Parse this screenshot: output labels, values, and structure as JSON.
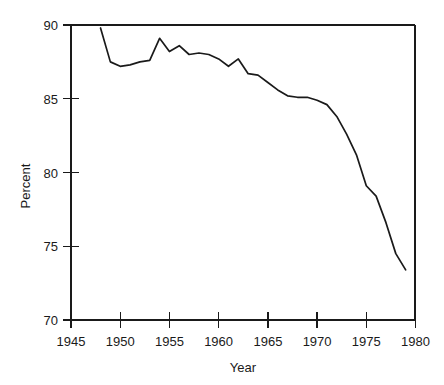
{
  "chart_data": {
    "type": "line",
    "title": "",
    "xlabel": "Year",
    "ylabel": "Percent",
    "xlim": [
      1945,
      1980
    ],
    "ylim": [
      70,
      90
    ],
    "grid": false,
    "legend": false,
    "xticks": [
      1945,
      1950,
      1955,
      1960,
      1965,
      1970,
      1975,
      1980
    ],
    "xtick_labels": [
      "1945",
      "1950",
      "1955",
      "1960",
      "1965",
      "1970",
      "1975",
      "1980"
    ],
    "yticks": [
      70,
      75,
      80,
      85,
      90
    ],
    "ytick_labels": [
      "70",
      "75",
      "80",
      "85",
      "90"
    ],
    "series": [
      {
        "name": "Percent",
        "color": "#1a1a1a",
        "x": [
          1948,
          1949,
          1950,
          1951,
          1952,
          1953,
          1954,
          1955,
          1956,
          1957,
          1958,
          1959,
          1960,
          1961,
          1962,
          1963,
          1964,
          1965,
          1966,
          1967,
          1968,
          1969,
          1970,
          1971,
          1972,
          1973,
          1974,
          1975,
          1976,
          1977,
          1978,
          1979
        ],
        "values": [
          89.8,
          87.5,
          87.2,
          87.3,
          87.5,
          87.6,
          89.1,
          88.2,
          88.6,
          88.0,
          88.1,
          88.0,
          87.7,
          87.2,
          87.7,
          86.7,
          86.6,
          86.1,
          85.6,
          85.2,
          85.1,
          85.1,
          84.9,
          84.6,
          83.8,
          82.6,
          81.2,
          79.1,
          78.4,
          76.6,
          74.5,
          73.4
        ],
        "start_year": 1948,
        "end_year": 1979,
        "start_value": 89.8,
        "end_value": 73.4,
        "peak_year": 1954,
        "peak_value": 89.1,
        "min_value": 73.4
      }
    ]
  },
  "axes": {
    "ylabel": "Percent",
    "xlabel": "Year"
  }
}
